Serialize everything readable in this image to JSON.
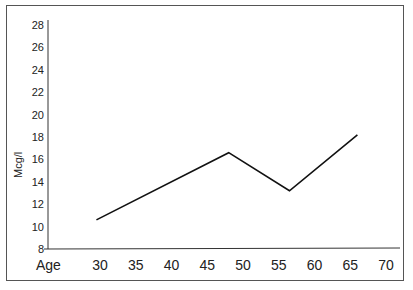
{
  "chart_data": {
    "type": "line",
    "title": "",
    "xlabel": "Age",
    "ylabel": "Mcg/l",
    "x_ticks": [
      "30",
      "35",
      "40",
      "45",
      "50",
      "55",
      "60",
      "65",
      "70"
    ],
    "y_ticks": [
      "8",
      "10",
      "12",
      "14",
      "16",
      "18",
      "20",
      "22",
      "24",
      "26",
      "28"
    ],
    "ylim": [
      8,
      28
    ],
    "xlim": [
      25,
      72
    ],
    "grid": false,
    "series": [
      {
        "name": "Mcg/l",
        "x": [
          29.5,
          48,
          56.5,
          66
        ],
        "values": [
          10.6,
          16.6,
          13.2,
          18.2
        ]
      }
    ]
  },
  "labels": {
    "x_title": "Age",
    "y_title": "Mcg/l"
  },
  "footer_fragment": "... (25)"
}
